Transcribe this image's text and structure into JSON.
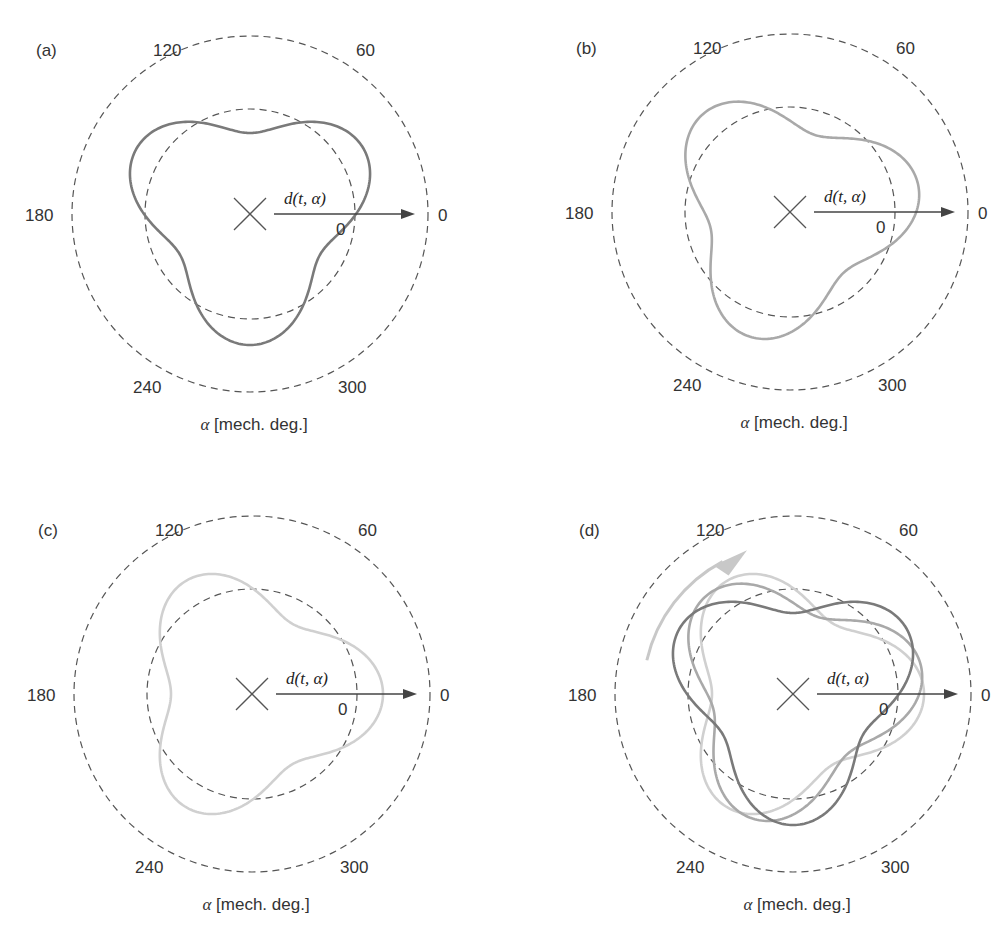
{
  "chart_data": [
    {
      "type": "polar-line",
      "panel": "(a)",
      "angle_ticks": [
        "0",
        "60",
        "120",
        "180",
        "240",
        "300"
      ],
      "radial_reference_label": "0",
      "vector_label": "d(t, α)",
      "xlabel": "α [mech. deg.]",
      "reference_circles": [
        "outer dashed",
        "inner dashed (zero deformation)"
      ],
      "series": [
        {
          "name": "t1",
          "color": "#7a7a7a",
          "shape": "3-lobe",
          "lobe_angles_deg": [
            30,
            150,
            270
          ],
          "mean_radius": 106,
          "amplitude": 25
        }
      ]
    },
    {
      "type": "polar-line",
      "panel": "(b)",
      "angle_ticks": [
        "0",
        "60",
        "120",
        "180",
        "240",
        "300"
      ],
      "radial_reference_label": "0",
      "vector_label": "d(t, α)",
      "xlabel": "α [mech. deg.]",
      "series": [
        {
          "name": "t2",
          "color": "#a9a9a9",
          "shape": "3-lobe",
          "lobe_angles_deg": [
            12,
            132,
            252
          ],
          "mean_radius": 106,
          "amplitude": 25
        }
      ]
    },
    {
      "type": "polar-line",
      "panel": "(c)",
      "angle_ticks": [
        "0",
        "60",
        "120",
        "180",
        "240",
        "300"
      ],
      "radial_reference_label": "0",
      "vector_label": "d(t, α)",
      "xlabel": "α [mech. deg.]",
      "series": [
        {
          "name": "t3",
          "color": "#d0d0d0",
          "shape": "3-lobe",
          "lobe_angles_deg": [
            0,
            120,
            240
          ],
          "mean_radius": 106,
          "amplitude": 25
        }
      ]
    },
    {
      "type": "polar-line",
      "panel": "(d)",
      "angle_ticks": [
        "0",
        "60",
        "120",
        "180",
        "240",
        "300"
      ],
      "radial_reference_label": "0",
      "vector_label": "d(t, α)",
      "xlabel": "α [mech. deg.]",
      "annotation": "curved arrow indicating rotation direction (counter-clockwise)",
      "series": [
        {
          "name": "t1",
          "color": "#7a7a7a",
          "lobe_angles_deg": [
            30,
            150,
            270
          ],
          "mean_radius": 106,
          "amplitude": 25
        },
        {
          "name": "t2",
          "color": "#a9a9a9",
          "lobe_angles_deg": [
            12,
            132,
            252
          ],
          "mean_radius": 106,
          "amplitude": 25
        },
        {
          "name": "t3",
          "color": "#d0d0d0",
          "lobe_angles_deg": [
            0,
            120,
            240
          ],
          "mean_radius": 106,
          "amplitude": 25
        }
      ]
    }
  ],
  "panels": [
    {
      "id": "a",
      "label": "(a)",
      "cx": 250,
      "cy": 214,
      "curves": [
        {
          "phase": 30,
          "color": "#7a7a7a"
        }
      ]
    },
    {
      "id": "b",
      "label": "(b)",
      "cx": 790,
      "cy": 212,
      "curves": [
        {
          "phase": 12,
          "color": "#a9a9a9"
        }
      ]
    },
    {
      "id": "c",
      "label": "(c)",
      "cx": 252,
      "cy": 694,
      "curves": [
        {
          "phase": 0,
          "color": "#d0d0d0"
        }
      ]
    },
    {
      "id": "d",
      "label": "(d)",
      "cx": 793,
      "cy": 694,
      "curves": [
        {
          "phase": 0,
          "color": "#d0d0d0"
        },
        {
          "phase": 12,
          "color": "#a9a9a9"
        },
        {
          "phase": 30,
          "color": "#7a7a7a"
        }
      ],
      "rotation_arrow": true
    }
  ],
  "geometry": {
    "outer_radius": 178,
    "inner_radius": 105,
    "mean_radius": 106,
    "amplitude": 25
  },
  "labels": {
    "tick_0": "0",
    "tick_60": "60",
    "tick_120": "120",
    "tick_180": "180",
    "tick_240": "240",
    "tick_300": "300",
    "zero": "0",
    "vector": "d(t, α)",
    "xlabel_symbol": "α",
    "xlabel_unit": " [mech. deg.]"
  },
  "colors": {
    "rotation_arrow": "#c8c8c8",
    "rings": "#555555"
  }
}
